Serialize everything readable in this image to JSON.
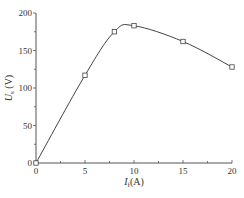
{
  "chart_data": {
    "type": "line",
    "title": "",
    "xlabel": "I_f (A)",
    "ylabel": "U_s (V)",
    "xlabel_main": "I",
    "xlabel_sub": "f",
    "xlabel_unit": "(A)",
    "ylabel_main": "U",
    "ylabel_sub": "s",
    "ylabel_unit": " (V)",
    "xlim": [
      0,
      20
    ],
    "ylim": [
      0,
      200
    ],
    "x_ticks": [
      0,
      5,
      10,
      15,
      20
    ],
    "y_ticks": [
      0,
      50,
      100,
      150,
      200
    ],
    "x_tick_labels": [
      "0",
      "5",
      "10",
      "15",
      "20"
    ],
    "y_tick_labels": [
      "0",
      "50",
      "100",
      "150",
      "200"
    ],
    "grid": false,
    "legend": null,
    "series": [
      {
        "name": "U_s vs I_f",
        "marker": "open-square",
        "line": "smooth",
        "x": [
          0,
          5,
          8,
          10,
          15,
          20
        ],
        "y": [
          0,
          117,
          175,
          183,
          162,
          128
        ]
      }
    ]
  },
  "colors": {
    "line": "#444444",
    "axis": "#555555",
    "text": "#333333",
    "background": "#ffffff"
  }
}
